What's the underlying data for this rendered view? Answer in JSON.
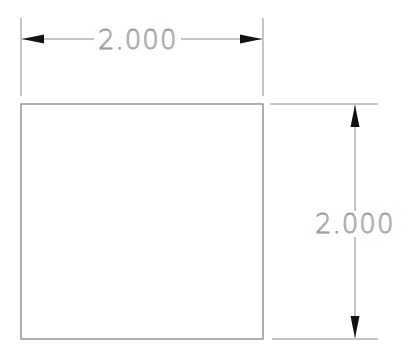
{
  "drawing": {
    "square": {
      "x": 21,
      "y": 104,
      "width": 242,
      "height": 235
    },
    "horizontal_dimension": {
      "label": "2.000",
      "line_y": 39,
      "x1": 21,
      "x2": 263
    },
    "vertical_dimension": {
      "label": "2.000",
      "line_x": 355,
      "y1": 104,
      "y2": 339
    }
  },
  "colors": {
    "line": "#8a8a8a",
    "arrow": "#111111",
    "background": "#ffffff"
  }
}
